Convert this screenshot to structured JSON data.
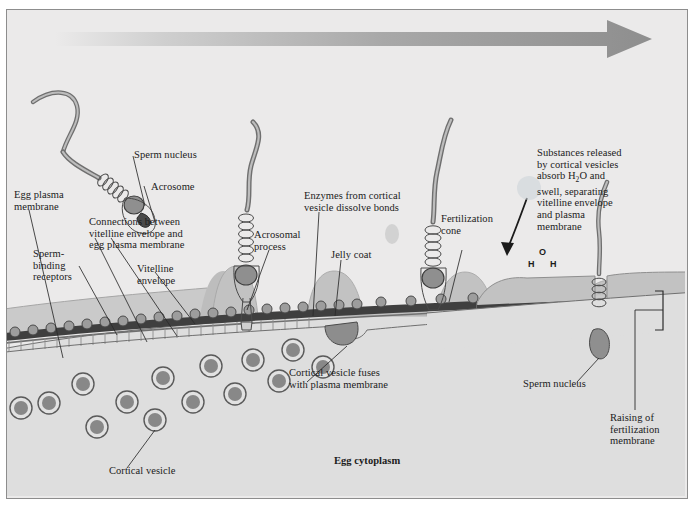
{
  "figure": {
    "title_strip_text": "",
    "timeline_arrow": "rightward-progression-arrow",
    "cytoplasm_label": "Egg cytoplasm"
  },
  "labels": [
    {
      "id": "sperm-nucleus-left",
      "text": "Sperm nucleus"
    },
    {
      "id": "acrosome",
      "text": "Acrosome"
    },
    {
      "id": "egg-plasma-membrane",
      "text": "Egg plasma\nmembrane"
    },
    {
      "id": "connections",
      "text": "Connections between\nvitelline envelope and\negg plasma membrane"
    },
    {
      "id": "sperm-binding-receptors",
      "text": "Sperm-\nbinding\nreceptors"
    },
    {
      "id": "vitelline-envelope",
      "text": "Vitelline\nenvelope"
    },
    {
      "id": "acrosomal-process",
      "text": "Acrosomal\nprocess"
    },
    {
      "id": "enzymes",
      "text": "Enzymes from cortical\nvesicle dissolve bonds"
    },
    {
      "id": "jelly-coat",
      "text": "Jelly coat"
    },
    {
      "id": "fertilization-cone",
      "text": "Fertilization\ncone"
    },
    {
      "id": "substances-released",
      "text": "Substances released\nby cortical vesicles\nabsorb H"
    },
    {
      "id": "substances-released-2",
      "text": "O and\nswell, separating\nvitelline envelope\nand plasma\nmembrane"
    },
    {
      "id": "cortical-vesicle-fuses",
      "text": "Cortical vesicle fuses\nwith plasma membrane"
    },
    {
      "id": "sperm-nucleus-right",
      "text": "Sperm nucleus"
    },
    {
      "id": "raising-membrane",
      "text": "Raising of\nfertilization\nmembrane"
    },
    {
      "id": "cortical-vesicle",
      "text": "Cortical vesicle"
    },
    {
      "id": "egg-cytoplasm",
      "text": "Egg cytoplasm"
    }
  ],
  "water_molecule": {
    "oxygen": "O",
    "hydrogen_left": "H",
    "hydrogen_right": "H",
    "subscript": "2"
  },
  "colors": {
    "panel_background": "#ebeaea",
    "frame_border": "#8d8d8d",
    "jelly_coat": "#c9c9c9",
    "vitelline_envelope": "#3c3c3c",
    "plasma_membrane": "#8f8f8f",
    "cytoplasm": "#dcdcdc",
    "cortical_vesicle_core": "#8a8a8a",
    "receptor": "#9a9a9a",
    "sperm_body": "#a3a3a3",
    "arrow": "#9b9b9b",
    "label_text": "#1b1b1b"
  }
}
